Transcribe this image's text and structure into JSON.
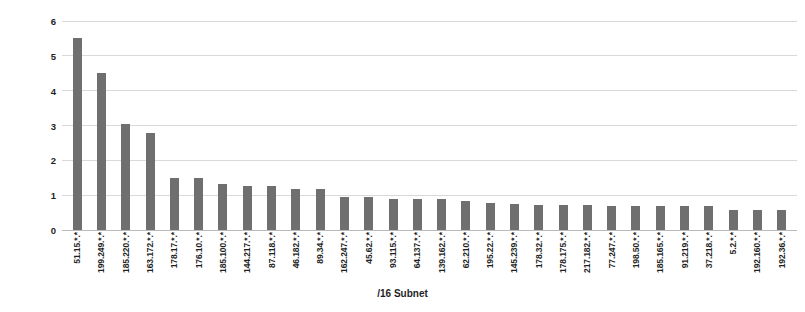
{
  "chart_data": {
    "type": "bar",
    "title": "",
    "xlabel": "/16 Subnet",
    "ylabel": "Percentage [%]",
    "ylim": [
      0,
      6
    ],
    "yticks": [
      0,
      1,
      2,
      3,
      4,
      5,
      6
    ],
    "grid": true,
    "legend": null,
    "bar_color": "#6f6f6f",
    "series_name": "Percentage",
    "categories": [
      "51.15.*.*",
      "199.249.*.*",
      "185.220.*.*",
      "163.172.*.*",
      "178.17.*.*",
      "176.10.*.*",
      "185.100.*.*",
      "144.217.*.*",
      "87.118.*.*",
      "46.182.*.*",
      "89.34.*.*",
      "162.247.*.*",
      "45.62.*.*",
      "93.115.*.*",
      "64.137.*.*",
      "139.162.*.*",
      "62.210.*.*",
      "195.22.*.*",
      "145.239.*.*",
      "178.32.*.*",
      "178.175.*.*",
      "217.182.*.*",
      "77.247.*.*",
      "198.50.*.*",
      "185.165.*.*",
      "91.219.*.*",
      "37.218.*.*",
      "5.2.*.*",
      "192.160.*.*",
      "192.36.*.*"
    ],
    "values": [
      5.5,
      4.5,
      3.05,
      2.78,
      1.5,
      1.5,
      1.32,
      1.25,
      1.25,
      1.18,
      1.18,
      0.95,
      0.95,
      0.9,
      0.9,
      0.88,
      0.82,
      0.78,
      0.75,
      0.72,
      0.72,
      0.72,
      0.7,
      0.7,
      0.68,
      0.68,
      0.68,
      0.58,
      0.58,
      0.58
    ]
  }
}
